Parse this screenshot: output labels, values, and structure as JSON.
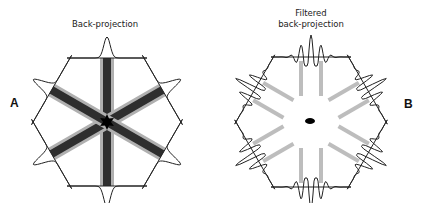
{
  "panels": [
    {
      "id": "A",
      "label": "A",
      "title_lines": [
        "Back-projection"
      ],
      "method": "unfiltered",
      "projection_count": 6,
      "projection_angles_deg": [
        0,
        60,
        120,
        180,
        240,
        300
      ],
      "profile": "single-peak",
      "reconstruction": "star-shaped blur"
    },
    {
      "id": "B",
      "label": "B",
      "title_lines": [
        "Filtered",
        "back-projection"
      ],
      "method": "filtered",
      "projection_count": 6,
      "projection_angles_deg": [
        0,
        60,
        120,
        180,
        240,
        300
      ],
      "profile": "ringing-peak",
      "reconstruction": "point"
    }
  ],
  "colors": {
    "line": "#222222",
    "bar_dark": "#2e2e2e",
    "bar_light": "#b0b0b0",
    "filtered_bar": "#bdbdbd",
    "center": "#000000"
  }
}
